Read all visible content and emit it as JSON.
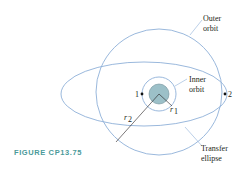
{
  "figure": {
    "caption": "FIGURE CP13.75",
    "labels": {
      "outer_orbit_1": "Outer",
      "outer_orbit_2": "orbit",
      "inner_orbit_1": "Inner",
      "inner_orbit_2": "orbit",
      "transfer_1": "Transfer",
      "transfer_2": "ellipse",
      "point_1": "1",
      "point_2": "2",
      "r1": "r",
      "r1_sub": "1",
      "r2": "r",
      "r2_sub": "2"
    },
    "colors": {
      "orbit_line": "#8fb0d8",
      "planet_fill": "#9cc0c8",
      "caption": "#4a9a9a",
      "text": "#231f20"
    }
  }
}
